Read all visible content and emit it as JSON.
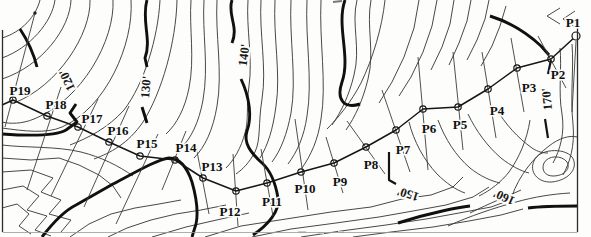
{
  "map": {
    "background": "#fdfdfb",
    "ink": "#161616",
    "border": {
      "left": {
        "x": 2.5,
        "y1": 30,
        "y2": 232
      },
      "right": {
        "x": 577.5,
        "y1": 28,
        "y2": 232
      },
      "bottom": {
        "y": 232.5,
        "x1": 2.5,
        "x2": 577.5
      }
    },
    "contour_labels": [
      {
        "text": "120'",
        "x": 67,
        "y": 80,
        "rot": -115
      },
      {
        "text": "130'",
        "x": 146,
        "y": 87,
        "rot": -85
      },
      {
        "text": "140'",
        "x": 244,
        "y": 55,
        "rot": -83
      },
      {
        "text": "150'",
        "x": 408,
        "y": 194,
        "rot": 197
      },
      {
        "text": "160'",
        "x": 504,
        "y": 197,
        "rot": 205
      },
      {
        "text": "170'",
        "x": 547,
        "y": 99,
        "rot": -95
      }
    ],
    "traverse": {
      "tail": [
        2,
        105
      ],
      "stations": [
        {
          "id": "P1",
          "x": 576,
          "y": 36,
          "lx": 573,
          "ly": 22,
          "open": true,
          "s": [
            576,
            41,
            572,
            112
          ]
        },
        {
          "id": "P2",
          "x": 551,
          "y": 59,
          "lx": 558,
          "ly": 74,
          "s": [
            538,
            36,
            566,
            88
          ]
        },
        {
          "id": "P3",
          "x": 517,
          "y": 68,
          "lx": 529,
          "ly": 87,
          "s": [
            511,
            38,
            524,
            112
          ]
        },
        {
          "id": "P4",
          "x": 488,
          "y": 89,
          "lx": 497,
          "ly": 110,
          "s": [
            482,
            52,
            496,
            138
          ]
        },
        {
          "id": "P5",
          "x": 458,
          "y": 107,
          "lx": 460,
          "ly": 124,
          "s": [
            453,
            52,
            463,
            150
          ]
        },
        {
          "id": "P6",
          "x": 423,
          "y": 109,
          "lx": 429,
          "ly": 128,
          "s": [
            418,
            57,
            428,
            170
          ]
        },
        {
          "id": "P7",
          "x": 396,
          "y": 130,
          "lx": 403,
          "ly": 149,
          "s": [
            382,
            90,
            410,
            172
          ]
        },
        {
          "id": "P8",
          "x": 366,
          "y": 147,
          "lx": 371,
          "ly": 164,
          "s": [
            347,
            121,
            385,
            174
          ]
        },
        {
          "id": "P9",
          "x": 334,
          "y": 163,
          "lx": 340,
          "ly": 181,
          "s": [
            326,
            137,
            343,
            193
          ]
        },
        {
          "id": "P10",
          "x": 301,
          "y": 172,
          "lx": 305,
          "ly": 188,
          "s": [
            295,
            119,
            308,
            210
          ]
        },
        {
          "id": "P11",
          "x": 267,
          "y": 183,
          "lx": 272,
          "ly": 201,
          "s": [
            261,
            149,
            273,
            216
          ]
        },
        {
          "id": "P12",
          "x": 236,
          "y": 191,
          "lx": 230,
          "ly": 211,
          "s": [
            233,
            154,
            238,
            226
          ]
        },
        {
          "id": "P13",
          "x": 203,
          "y": 178,
          "lx": 212,
          "ly": 166,
          "s": [
            196,
            146,
            209,
            214
          ]
        },
        {
          "id": "P14",
          "x": 175,
          "y": 160,
          "lx": 186,
          "ly": 147,
          "s": [
            186,
            131,
            162,
            190
          ]
        },
        {
          "id": "P15",
          "x": 140,
          "y": 156,
          "lx": 147,
          "ly": 143,
          "s": [
            158,
            134,
            116,
            224
          ]
        },
        {
          "id": "P16",
          "x": 109,
          "y": 142,
          "lx": 118,
          "ly": 130,
          "s": [
            129,
            106,
            84,
            207
          ]
        },
        {
          "id": "P17",
          "x": 78,
          "y": 127,
          "lx": 92,
          "ly": 118,
          "s": [
            98,
            99,
            51,
            196
          ]
        },
        {
          "id": "P18",
          "x": 47,
          "y": 116,
          "lx": 56,
          "ly": 104,
          "s": [
            61,
            87,
            27,
            190
          ]
        },
        {
          "id": "P19",
          "x": 13,
          "y": 100,
          "lx": 20,
          "ly": 90,
          "s": [
            35,
            13,
            5,
            127
          ]
        }
      ]
    },
    "section_dot": {
      "x": 35,
      "y": 13
    }
  }
}
